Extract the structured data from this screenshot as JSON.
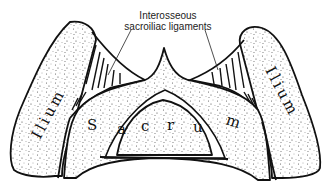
{
  "figure": {
    "type": "anatomical-line-drawing",
    "labels": {
      "ligaments_line1": "Interosseous",
      "ligaments_line2": "sacroiliac ligaments",
      "left_ilium": "Ilium",
      "right_ilium": "Ilium",
      "sacrum_letters": [
        "S",
        "a",
        "c",
        "r",
        "u",
        "m"
      ]
    },
    "colors": {
      "ink": "#111111",
      "background": "#ffffff",
      "stipple": "#555555"
    }
  }
}
